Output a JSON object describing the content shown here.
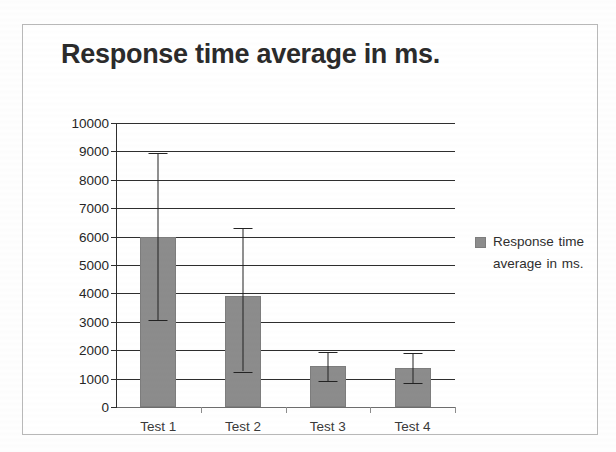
{
  "chart_data": {
    "type": "bar",
    "title": "Response time average in ms.",
    "xlabel": "",
    "ylabel": "",
    "categories": [
      "Test 1",
      "Test 2",
      "Test 3",
      "Test 4"
    ],
    "values": [
      6000,
      3900,
      1450,
      1380
    ],
    "series": [
      {
        "name": "Response time average in ms.",
        "values": [
          6000,
          3900,
          1450,
          1380
        ],
        "error_upper": [
          8950,
          6300,
          1950,
          1900
        ],
        "error_lower": [
          3070,
          1250,
          920,
          840
        ],
        "color": "#8c8c8c"
      }
    ],
    "ylim": [
      0,
      10000
    ],
    "yticks": [
      0,
      1000,
      2000,
      3000,
      4000,
      5000,
      6000,
      7000,
      8000,
      9000,
      10000
    ],
    "ytick_labels": [
      "0",
      "1000",
      "2000",
      "3000",
      "4000",
      "5000",
      "6000",
      "7000",
      "8000",
      "9000",
      "10000"
    ],
    "grid": true,
    "grid_axis": "y",
    "legend": {
      "position": "right",
      "entries": [
        {
          "label": "Response time average in ms.",
          "color": "#8c8c8c"
        }
      ]
    },
    "error_bars": true,
    "border_color": "#b9b9b9",
    "axis_color": "#2e2e2e",
    "background": "#ffffff"
  },
  "legend": {
    "text": "Response time average in ms."
  }
}
